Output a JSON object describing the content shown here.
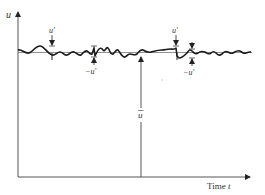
{
  "diagram": {
    "type": "turbulent-velocity-fluctuation",
    "y_axis_label": "u",
    "x_axis_label": "Time t",
    "mean_label": "ū",
    "fluctuation_positive_label": "u′",
    "fluctuation_negative_label": "−u′",
    "annotations": [
      {
        "kind": "positive",
        "label": "u′"
      },
      {
        "kind": "negative",
        "label": "−u′"
      },
      {
        "kind": "positive",
        "label": "u′"
      },
      {
        "kind": "negative",
        "label": "−u′"
      }
    ],
    "colors": {
      "axis": "#555555",
      "signal": "#1a1a1a",
      "mean_line": "#777777",
      "text": "#333333"
    }
  }
}
